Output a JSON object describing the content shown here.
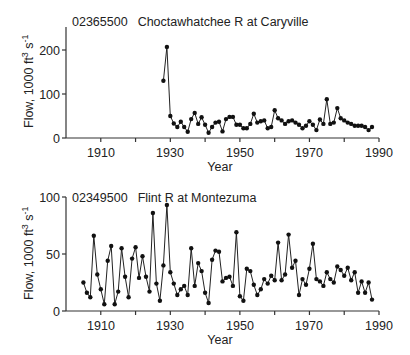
{
  "chart_data": [
    {
      "type": "line",
      "title": "02365500   Choctawhatchee R at Caryville",
      "station_id": "02365500",
      "station_name": "Choctawhatchee R at Caryville",
      "xlabel": "Year",
      "ylabel": "Flow, 1000 ft3 s-1",
      "xlim": [
        1900,
        1990
      ],
      "ylim": [
        0,
        250
      ],
      "x_ticks": [
        1910,
        1930,
        1950,
        1970,
        1990
      ],
      "x_minor_ticks": [
        1920,
        1940,
        1960,
        1980
      ],
      "y_ticks": [
        0,
        100,
        200
      ],
      "grid": false,
      "marker": "filled-circle",
      "x": [
        1928,
        1929,
        1930,
        1931,
        1932,
        1933,
        1934,
        1935,
        1936,
        1937,
        1938,
        1939,
        1940,
        1941,
        1942,
        1943,
        1944,
        1945,
        1946,
        1947,
        1948,
        1949,
        1950,
        1951,
        1952,
        1953,
        1954,
        1955,
        1956,
        1957,
        1958,
        1959,
        1960,
        1961,
        1962,
        1963,
        1964,
        1965,
        1966,
        1967,
        1968,
        1969,
        1970,
        1971,
        1972,
        1973,
        1974,
        1975,
        1976,
        1977,
        1978,
        1979,
        1980,
        1981,
        1982,
        1983,
        1984,
        1985,
        1986,
        1987,
        1988
      ],
      "values": [
        130,
        207,
        50,
        33,
        25,
        37,
        25,
        14,
        43,
        57,
        32,
        47,
        30,
        12,
        25,
        35,
        37,
        15,
        43,
        48,
        48,
        30,
        30,
        22,
        22,
        32,
        55,
        35,
        38,
        40,
        22,
        25,
        63,
        45,
        40,
        32,
        38,
        40,
        35,
        30,
        22,
        28,
        38,
        30,
        18,
        42,
        32,
        88,
        32,
        35,
        68,
        45,
        40,
        35,
        32,
        28,
        28,
        28,
        25,
        18,
        25
      ]
    },
    {
      "type": "line",
      "title": "02349500   Flint R at Montezuma",
      "station_id": "02349500",
      "station_name": "Flint R at Montezuma",
      "xlabel": "Year",
      "ylabel": "Flow, 1000 ft3 s-1",
      "xlim": [
        1900,
        1990
      ],
      "ylim": [
        0,
        100
      ],
      "x_ticks": [
        1910,
        1930,
        1950,
        1970,
        1990
      ],
      "x_minor_ticks": [
        1920,
        1940,
        1960,
        1980
      ],
      "y_ticks": [
        0,
        50,
        100
      ],
      "grid": false,
      "marker": "filled-circle",
      "x": [
        1905,
        1906,
        1907,
        1908,
        1909,
        1910,
        1911,
        1912,
        1913,
        1914,
        1915,
        1916,
        1917,
        1918,
        1919,
        1920,
        1921,
        1922,
        1923,
        1924,
        1925,
        1926,
        1927,
        1928,
        1929,
        1930,
        1931,
        1932,
        1933,
        1934,
        1935,
        1936,
        1937,
        1938,
        1939,
        1940,
        1941,
        1942,
        1943,
        1944,
        1945,
        1946,
        1947,
        1948,
        1949,
        1950,
        1951,
        1952,
        1953,
        1954,
        1955,
        1956,
        1957,
        1958,
        1959,
        1960,
        1961,
        1962,
        1963,
        1964,
        1965,
        1966,
        1967,
        1968,
        1969,
        1970,
        1971,
        1972,
        1973,
        1974,
        1975,
        1976,
        1977,
        1978,
        1979,
        1980,
        1981,
        1982,
        1983,
        1984,
        1985,
        1986,
        1987,
        1988
      ],
      "values": [
        25,
        16,
        12,
        66,
        32,
        19,
        6,
        44,
        57,
        6,
        17,
        55,
        30,
        12,
        46,
        56,
        29,
        48,
        30,
        17,
        86,
        24,
        9,
        40,
        93,
        34,
        24,
        14,
        19,
        22,
        14,
        55,
        22,
        42,
        35,
        16,
        7,
        45,
        53,
        52,
        26,
        29,
        30,
        22,
        69,
        13,
        9,
        37,
        35,
        23,
        14,
        19,
        28,
        24,
        31,
        27,
        60,
        27,
        32,
        67,
        38,
        44,
        14,
        28,
        23,
        37,
        59,
        28,
        26,
        22,
        34,
        28,
        25,
        39,
        36,
        31,
        38,
        27,
        34,
        16,
        26,
        16,
        25,
        10
      ]
    }
  ],
  "charts": {
    "top": {
      "station_id": "02365500",
      "station_name": "Choctawhatchee R at Caryville",
      "ylabel_prefix": "Flow, 1000 ft",
      "ylabel_sup1": "3",
      "ylabel_mid": " s",
      "ylabel_sup2": "-1",
      "xlabel": "Year",
      "y_tick_labels": [
        "0",
        "100",
        "200"
      ],
      "x_tick_labels": [
        "1910",
        "1930",
        "1950",
        "1970",
        "1990"
      ]
    },
    "bottom": {
      "station_id": "02349500",
      "station_name": "Flint R at Montezuma",
      "ylabel_prefix": "Flow, 1000 ft",
      "ylabel_sup1": "3",
      "ylabel_mid": " s",
      "ylabel_sup2": "-1",
      "xlabel": "Year",
      "y_tick_labels": [
        "0",
        "50",
        "100"
      ],
      "x_tick_labels": [
        "1910",
        "1930",
        "1950",
        "1970",
        "1990"
      ]
    }
  }
}
